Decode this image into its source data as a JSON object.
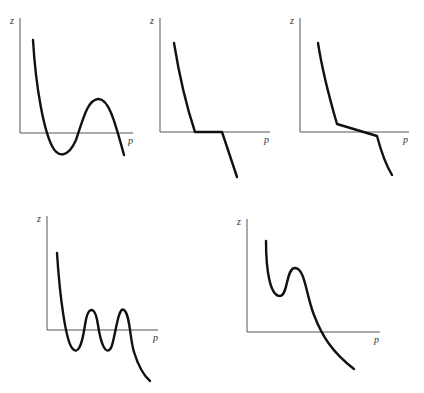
{
  "figure": {
    "panels": [
      {
        "id": "panel-1",
        "shape": "S-curve (one minimum below axis, one maximum above)",
        "y_label": "z",
        "x_label": "p",
        "axis": {
          "origin": [
            20,
            133
          ],
          "y_top": 18,
          "x_end": 133
        },
        "label_pos": {
          "z": [
            10,
            24
          ],
          "p": [
            128,
            144
          ]
        },
        "curve_path": "M33,40 C36,90 44,130 52,146 C58,158 68,158 76,140 C84,116 88,100 98,99 C108,98 114,118 124,155"
      },
      {
        "id": "panel-2",
        "shape": "Decreasing with flat segment on axis",
        "y_label": "z",
        "x_label": "p",
        "axis": {
          "origin": [
            160,
            132
          ],
          "y_top": 18,
          "x_end": 270
        },
        "label_pos": {
          "z": [
            150,
            24
          ],
          "p": [
            264,
            143
          ]
        },
        "curve_path": "M174,43 C180,80 186,105 195,132 L222,132 L237,177"
      },
      {
        "id": "panel-3",
        "shape": "Decreasing with shallow slope segment crossing axis",
        "y_label": "z",
        "x_label": "p",
        "axis": {
          "origin": [
            300,
            132
          ],
          "y_top": 18,
          "x_end": 409
        },
        "label_pos": {
          "z": [
            290,
            24
          ],
          "p": [
            403,
            143
          ]
        },
        "curve_path": "M318,43 C323,75 330,100 337,124 L377,136 C382,155 386,165 392,175"
      },
      {
        "id": "panel-4",
        "shape": "Multiple oscillations (two maxima, two minima) then decreasing",
        "y_label": "z",
        "x_label": "p",
        "axis": {
          "origin": [
            47,
            330
          ],
          "y_top": 216,
          "x_end": 158
        },
        "label_pos": {
          "z": [
            37,
            222
          ],
          "p": [
            153,
            341
          ]
        },
        "curve_path": "M57,253 C60,300 66,340 72,348 C78,356 82,345 85,325 C88,305 95,305 98,325 C101,345 106,356 111,348 C115,340 118,305 124,310 C130,314 130,340 134,352 C138,365 143,375 150,381"
      },
      {
        "id": "panel-5",
        "shape": "Local minimum and maximum above axis, then decreasing through axis",
        "y_label": "z",
        "x_label": "p",
        "axis": {
          "origin": [
            247,
            332
          ],
          "y_top": 219,
          "x_end": 380
        },
        "label_pos": {
          "z": [
            237,
            225
          ],
          "p": [
            374,
            343
          ]
        },
        "curve_path": "M266,241 C266,270 270,296 280,296 C288,296 286,268 295,268 C305,268 306,295 314,315 C322,336 332,352 354,369"
      }
    ]
  }
}
